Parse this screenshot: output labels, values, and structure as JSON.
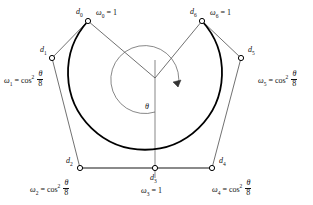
{
  "figure": {
    "background_color": "#ffffff",
    "ink_color": "#111111",
    "curve_color": "#000000",
    "angle_symbol": "θ",
    "angle_label": "θ"
  },
  "points": [
    {
      "id": "d0",
      "point_label": "d",
      "point_sub": "0",
      "weight_var": "ω",
      "weight_sub": "0",
      "weight_text": "ω₀ = 1",
      "weight_rhs": "1",
      "weight_is_fraction": false,
      "x": 88,
      "y": 21
    },
    {
      "id": "d1",
      "point_label": "d",
      "point_sub": "1",
      "weight_var": "ω",
      "weight_sub": "1",
      "weight_text": "ω₁ = cos² θ/8",
      "weight_rhs": "cos",
      "weight_sup": "2",
      "weight_num": "θ",
      "weight_den": "8",
      "weight_is_fraction": true,
      "x": 52,
      "y": 58
    },
    {
      "id": "d2",
      "point_label": "d",
      "point_sub": "2",
      "weight_var": "ω",
      "weight_sub": "2",
      "weight_text": "ω₂ = cos² θ/8",
      "weight_rhs": "cos",
      "weight_sup": "2",
      "weight_num": "θ",
      "weight_den": "8",
      "weight_is_fraction": true,
      "x": 80,
      "y": 168
    },
    {
      "id": "d3",
      "point_label": "d",
      "point_sub": "3",
      "weight_var": "ω",
      "weight_sub": "3",
      "weight_text": "ω₃ = 1",
      "weight_rhs": "1",
      "weight_is_fraction": false,
      "x": 155,
      "y": 168
    },
    {
      "id": "d4",
      "point_label": "d",
      "point_sub": "4",
      "weight_var": "ω",
      "weight_sub": "4",
      "weight_text": "ω₄ = cos² θ/8",
      "weight_rhs": "cos",
      "weight_sup": "2",
      "weight_num": "θ",
      "weight_den": "8",
      "weight_is_fraction": true,
      "x": 212,
      "y": 168
    },
    {
      "id": "d5",
      "point_label": "d",
      "point_sub": "5",
      "weight_var": "ω",
      "weight_sub": "5",
      "weight_text": "ω₅ = cos² θ/8",
      "weight_rhs": "cos",
      "weight_sup": "2",
      "weight_num": "θ",
      "weight_den": "8",
      "weight_is_fraction": true,
      "x": 241,
      "y": 58
    },
    {
      "id": "d6",
      "point_label": "d",
      "point_sub": "6",
      "weight_var": "ω",
      "weight_sub": "6",
      "weight_text": "ω₆ = 1",
      "weight_rhs": "1",
      "weight_is_fraction": false,
      "x": 202,
      "y": 21
    }
  ],
  "equals": "=",
  "center": {
    "x": 155,
    "y": 78
  }
}
